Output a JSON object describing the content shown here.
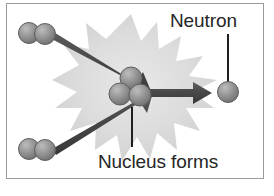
{
  "figure": {
    "kind": "science-diagram",
    "border_color": "#9a9a9a",
    "background_color": "#ffffff"
  },
  "labels": {
    "neutron": "Neutron",
    "nucleus_forms": "Nucleus forms",
    "text_color": "#262626"
  },
  "colors": {
    "sphere_fill": "#8f8f8f",
    "sphere_fill_light": "#b4b4b4",
    "sphere_outline": "#5a5a5a",
    "arrow": "#4a4a4a",
    "burst": "#d2d2d2",
    "burst_inner": "#e3e3e3",
    "leader_line": "#1f1f1f"
  },
  "elements": {
    "burst": {
      "name": "energy-burst-starburst",
      "points": 14
    },
    "reactant_pair_top": {
      "name": "deuterium-pair-top",
      "particle_count": 2
    },
    "reactant_pair_bottom": {
      "name": "tritium-pair-bottom",
      "particle_count": 2
    },
    "nucleus_cluster": {
      "name": "helium-nucleus-cluster",
      "particle_count": 3
    },
    "neutron_particle": {
      "name": "emitted-neutron-particle",
      "particle_count": 1
    },
    "arrow_top": {
      "name": "reactant-arrow-top"
    },
    "arrow_bottom": {
      "name": "reactant-arrow-bottom"
    },
    "arrow_neutron": {
      "name": "neutron-emission-arrow"
    },
    "leader_neutron": {
      "name": "neutron-leader-line"
    },
    "leader_nucleus": {
      "name": "nucleus-leader-line"
    }
  }
}
